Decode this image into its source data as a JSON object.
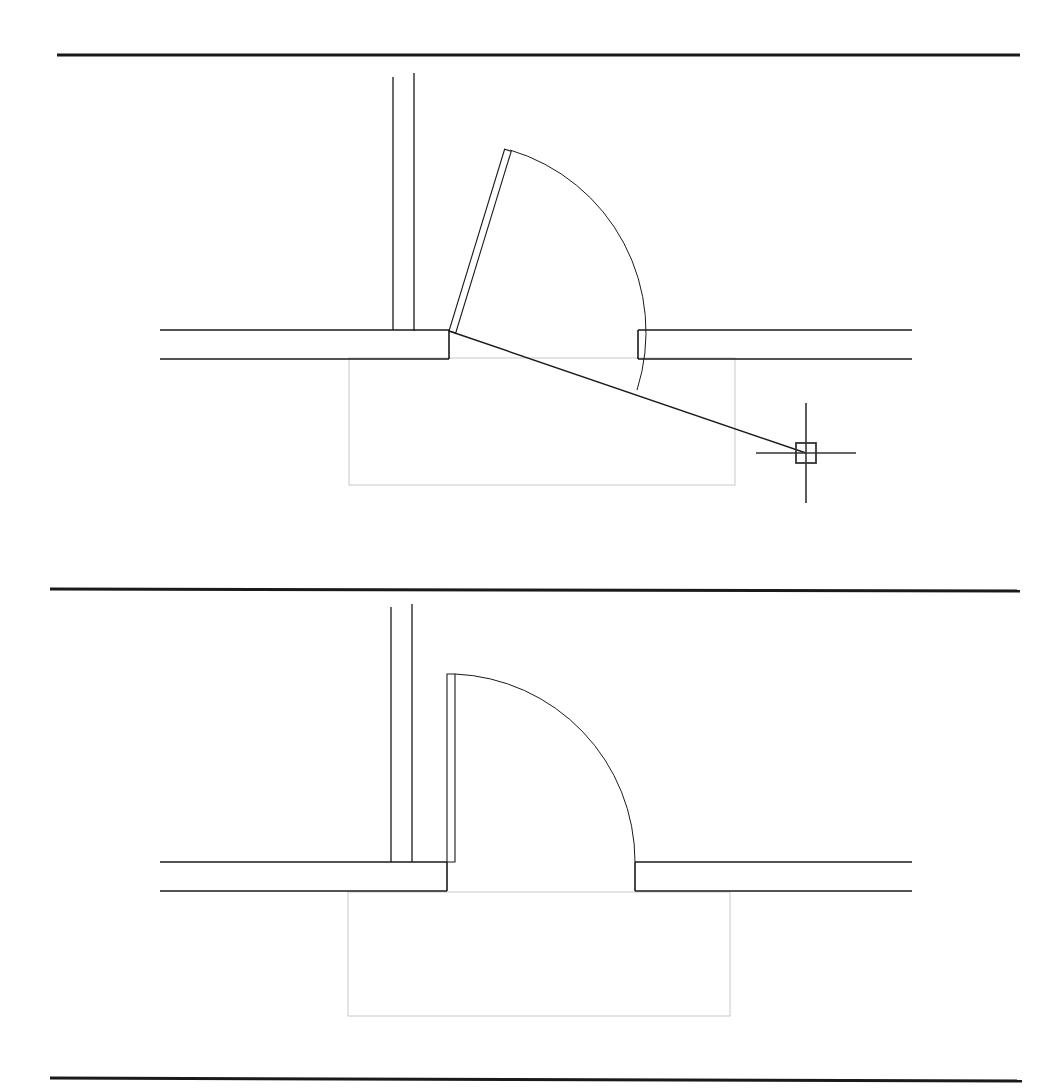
{
  "document": {
    "type": "cad-drawing",
    "title": "Door swing plan - two views",
    "background_color": "#ffffff",
    "line_color": "#1a1a1a",
    "helper_color": "#c8c8c8",
    "cursor_color": "#333333",
    "width": 1059,
    "height": 1090
  },
  "separators": [
    {
      "name": "top-rule",
      "x1": 57,
      "y1": 55,
      "x2": 1020,
      "y2": 55,
      "thickness": 3.0
    },
    {
      "name": "middle-rule",
      "x1": 50,
      "y1": 589,
      "x2": 1020,
      "y2": 591,
      "thickness": 3.0
    },
    {
      "name": "bottom-rule",
      "x1": 50,
      "y1": 1078,
      "x2": 1022,
      "y2": 1081,
      "thickness": 3.0
    }
  ],
  "views": [
    {
      "id": "view-top",
      "name": "door-open-partial-with-cursor",
      "caption": "",
      "wall": {
        "left_horizontal_top": {
          "x1": 160,
          "y1": 330,
          "x2": 449,
          "y2": 330
        },
        "left_horizontal_bottom": {
          "x1": 160,
          "y1": 359,
          "x2": 449,
          "y2": 359
        },
        "left_jamb_vertical": {
          "x1": 449,
          "y1": 330,
          "x2": 449,
          "y2": 359
        },
        "right_horizontal_top": {
          "x1": 638,
          "y1": 330,
          "x2": 912,
          "y2": 330
        },
        "right_horizontal_bottom": {
          "x1": 638,
          "y1": 359,
          "x2": 912,
          "y2": 359
        },
        "right_jamb_vertical": {
          "x1": 638,
          "y1": 330,
          "x2": 638,
          "y2": 359
        },
        "vertical_wall_left_line": {
          "x1": 393,
          "y1": 77,
          "x2": 393,
          "y2": 330
        },
        "vertical_wall_right_line": {
          "x1": 414,
          "y1": 73,
          "x2": 414,
          "y2": 331
        }
      },
      "door": {
        "hinge_x": 449,
        "hinge_y": 331,
        "leaf_angle_deg": 73,
        "leaf_length": 190,
        "leaf_thickness": 7,
        "leaf_tip_x": 505,
        "leaf_tip_y": 148,
        "arc_radius": 190,
        "arc_start_x": 510,
        "arc_start_y": 150,
        "arc_end_x": 637,
        "arc_end_y": 390
      },
      "swing_line": {
        "x1": 449,
        "y1": 331,
        "x2": 806,
        "y2": 453
      },
      "helper_rect": {
        "x": 349,
        "y": 358,
        "width": 386,
        "height": 127
      },
      "cursor": {
        "name": "crosshair-cursor",
        "x": 806,
        "y": 453,
        "arm_length": 50,
        "pickbox_size": 20
      }
    },
    {
      "id": "view-bottom",
      "name": "door-closed-ninety-degrees",
      "caption": "",
      "wall": {
        "left_horizontal_top": {
          "x1": 160,
          "y1": 862,
          "x2": 447,
          "y2": 862
        },
        "left_horizontal_bottom": {
          "x1": 160,
          "y1": 891,
          "x2": 447,
          "y2": 891
        },
        "left_jamb_vertical": {
          "x1": 447,
          "y1": 862,
          "x2": 447,
          "y2": 891
        },
        "right_horizontal_top": {
          "x1": 635,
          "y1": 862,
          "x2": 912,
          "y2": 862
        },
        "right_horizontal_bottom": {
          "x1": 635,
          "y1": 891,
          "x2": 912,
          "y2": 891
        },
        "right_jamb_vertical": {
          "x1": 635,
          "y1": 862,
          "x2": 635,
          "y2": 891
        },
        "vertical_wall_left_line": {
          "x1": 391,
          "y1": 607,
          "x2": 391,
          "y2": 862
        },
        "vertical_wall_right_line": {
          "x1": 412,
          "y1": 604,
          "x2": 412,
          "y2": 862
        }
      },
      "door": {
        "hinge_x": 447,
        "hinge_y": 862,
        "leaf_angle_deg": 90,
        "leaf_length": 188,
        "leaf_thickness": 8,
        "leaf_tip_x": 447,
        "leaf_tip_y": 674,
        "arc_radius": 188,
        "arc_start_x": 455,
        "arc_start_y": 674,
        "arc_end_x": 635,
        "arc_end_y": 862
      },
      "helper_rect": {
        "x": 348,
        "y": 892,
        "width": 382,
        "height": 124
      }
    }
  ]
}
